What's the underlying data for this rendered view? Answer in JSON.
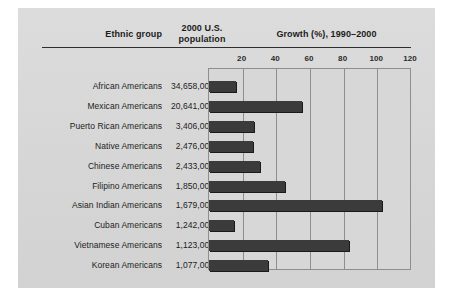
{
  "figure": {
    "panel_color": "#d9d9d9",
    "bar_color": "#3b3b3b",
    "grid_color": "#8e8e8e"
  },
  "header": {
    "col_ethnic": "Ethnic group",
    "col_population_line1": "2000 U.S.",
    "col_population_line2": "population",
    "col_growth": "Growth (%), 1990–2000"
  },
  "chart_data": {
    "type": "bar",
    "orientation": "horizontal",
    "title": "Growth (%), 1990–2000",
    "xlabel": "Growth (%), 1990–2000",
    "ylabel": "Ethnic group",
    "xlim": [
      0,
      120
    ],
    "xticks": [
      20,
      40,
      60,
      80,
      100,
      120
    ],
    "grid": true,
    "legend": "none",
    "categories": [
      "African Americans",
      "Mexican Americans",
      "Puerto Rican Americans",
      "Native Americans",
      "Chinese Americans",
      "Filipino Americans",
      "Asian Indian Americans",
      "Cuban Americans",
      "Vietnamese Americans",
      "Korean Americans"
    ],
    "populations": [
      "34,658,000",
      "20,641,000",
      "3,406,000",
      "2,476,000",
      "2,433,000",
      "1,850,000",
      "1,679,000",
      "1,242,000",
      "1,123,000",
      "1,077,000"
    ],
    "values": [
      16,
      55,
      27,
      26,
      30,
      45,
      103,
      15,
      83,
      35
    ],
    "series": [
      {
        "name": "Growth (%), 1990–2000",
        "values": [
          16,
          55,
          27,
          26,
          30,
          45,
          103,
          15,
          83,
          35
        ]
      }
    ]
  }
}
